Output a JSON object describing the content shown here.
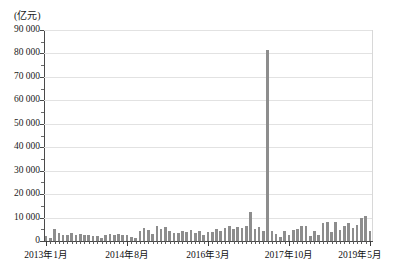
{
  "chart_data": {
    "type": "bar",
    "title": "",
    "subtitle": "",
    "unit_label": "(亿元)",
    "xlabel": "",
    "ylabel": "",
    "ylim": [
      0,
      90000
    ],
    "ytick_step": 10000,
    "grid": true,
    "legend": null,
    "bar_color": "#8d8d8d",
    "axis_color": "#4a4a4a",
    "grid_color": "#e2e2e2",
    "ytick_labels": [
      "90 000",
      "80 000",
      "70 000",
      "60 000",
      "50 000",
      "40 000",
      "30 000",
      "20 000",
      "10 000",
      "0"
    ],
    "ytick_values": [
      90000,
      80000,
      70000,
      60000,
      50000,
      40000,
      30000,
      20000,
      10000,
      0
    ],
    "xtick_labels": [
      "2013年1月",
      "2014年8月",
      "2016年3月",
      "2017年10月",
      "2019年5月"
    ],
    "xtick_indices": [
      0,
      19,
      38,
      57,
      76
    ],
    "x_start": "2013年1月",
    "x_end": "2019年5月",
    "n_points": 77,
    "categories": [
      "2013年1月",
      "2013年2月",
      "2013年3月",
      "2013年4月",
      "2013年5月",
      "2013年6月",
      "2013年7月",
      "2013年8月",
      "2013年9月",
      "2013年10月",
      "2013年11月",
      "2013年12月",
      "2014年1月",
      "2014年2月",
      "2014年3月",
      "2014年4月",
      "2014年5月",
      "2014年6月",
      "2014年7月",
      "2014年8月",
      "2014年9月",
      "2014年10月",
      "2014年11月",
      "2014年12月",
      "2015年1月",
      "2015年2月",
      "2015年3月",
      "2015年4月",
      "2015年5月",
      "2015年6月",
      "2015年7月",
      "2015年8月",
      "2015年9月",
      "2015年10月",
      "2015年11月",
      "2015年12月",
      "2016年1月",
      "2016年2月",
      "2016年3月",
      "2016年4月",
      "2016年5月",
      "2016年6月",
      "2016年7月",
      "2016年8月",
      "2016年9月",
      "2016年10月",
      "2016年11月",
      "2016年12月",
      "2017年1月",
      "2017年2月",
      "2017年3月",
      "2017年4月",
      "2017年5月",
      "2017年6月",
      "2017年7月",
      "2017年8月",
      "2017年9月",
      "2017年10月",
      "2017年11月",
      "2017年12月",
      "2018年1月",
      "2018年2月",
      "2018年3月",
      "2018年4月",
      "2018年5月",
      "2018年6月",
      "2018年7月",
      "2018年8月",
      "2018年9月",
      "2018年10月",
      "2018年11月",
      "2018年12月",
      "2019年1月",
      "2019年2月",
      "2019年3月",
      "2019年4月",
      "2019年5月"
    ],
    "values": [
      2300,
      1400,
      5100,
      3600,
      2700,
      2500,
      3300,
      2600,
      2900,
      2400,
      2500,
      2300,
      2000,
      1200,
      2700,
      2800,
      2400,
      2900,
      2600,
      2500,
      1800,
      1100,
      4200,
      5600,
      4700,
      3100,
      6300,
      5200,
      5900,
      4300,
      3600,
      3300,
      4200,
      3800,
      4600,
      3500,
      4200,
      2600,
      3800,
      3700,
      5100,
      4400,
      5700,
      6200,
      5200,
      5900,
      5400,
      6600,
      12400,
      5200,
      5800,
      4100,
      81500,
      4400,
      2800,
      1800,
      4200,
      2600,
      4700,
      5200,
      6500,
      6300,
      2300,
      4200,
      2600,
      7500,
      8100,
      3800,
      7900,
      4900,
      6500,
      7800,
      5400,
      6900,
      9800,
      10500,
      4100
    ],
    "annotations": [
      {
        "index": 52,
        "label": "2017年5月",
        "value": 81500,
        "note": "spike"
      }
    ]
  }
}
